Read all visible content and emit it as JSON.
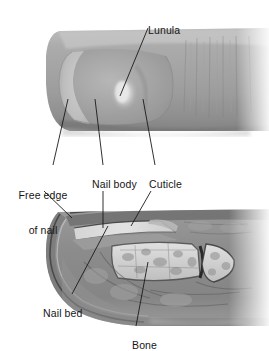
{
  "figure": {
    "title_visible": false,
    "kind": "anatomy-figure",
    "background_color": "#ffffff",
    "panels": [
      {
        "name": "fingertip-photograph",
        "description": "Grayscale photograph of a fingertip showing the nail from above",
        "bounds": {
          "x": 46,
          "y": 28,
          "width": 223,
          "height": 105
        }
      },
      {
        "name": "finger-cross-section",
        "description": "Grayscale sagittal cross-section of the distal finger showing nail, nail bed and bone",
        "bounds": {
          "x": 44,
          "y": 208,
          "width": 225,
          "height": 118
        }
      }
    ]
  },
  "labels": [
    {
      "id": "lunula",
      "text": "Lunula",
      "x": 136,
      "y": 14,
      "align": "left",
      "lines": [
        "Lunula"
      ]
    },
    {
      "id": "free-edge",
      "text": "Free edge of nail",
      "x": 13,
      "y": 168,
      "align": "center",
      "lines": [
        "Free edge",
        "of nail"
      ]
    },
    {
      "id": "nail-body",
      "text": "Nail body",
      "x": 80,
      "y": 168,
      "align": "left",
      "lines": [
        "Nail body"
      ]
    },
    {
      "id": "cuticle",
      "text": "Cuticle",
      "x": 137,
      "y": 168,
      "align": "left",
      "lines": [
        "Cuticle"
      ]
    },
    {
      "id": "nail-bed",
      "text": "Nail bed",
      "x": 31,
      "y": 297,
      "align": "left",
      "lines": [
        "Nail bed"
      ]
    },
    {
      "id": "bone",
      "text": "Bone",
      "x": 120,
      "y": 329,
      "align": "left",
      "lines": [
        "Bone"
      ]
    }
  ],
  "leader_lines": [
    {
      "id": "leader-lunula",
      "from": [
        148,
        28
      ],
      "to": [
        120,
        96
      ]
    },
    {
      "id": "leader-free-edge-up",
      "from": [
        53,
        165
      ],
      "to": [
        68,
        99
      ]
    },
    {
      "id": "leader-nail-body-up",
      "from": [
        103,
        165
      ],
      "to": [
        95,
        99
      ]
    },
    {
      "id": "leader-cuticle-up",
      "from": [
        155,
        165
      ],
      "to": [
        143,
        99
      ]
    },
    {
      "id": "leader-free-edge-down",
      "from": [
        44,
        191
      ],
      "to": [
        72,
        218
      ]
    },
    {
      "id": "leader-nail-body-down",
      "from": [
        103,
        191
      ],
      "to": [
        103,
        228
      ]
    },
    {
      "id": "leader-cuticle-down",
      "from": [
        151,
        191
      ],
      "to": [
        131,
        226
      ]
    },
    {
      "id": "leader-nail-bed",
      "from": [
        72,
        294
      ],
      "to": [
        108,
        226
      ]
    },
    {
      "id": "leader-bone",
      "from": [
        136,
        326
      ],
      "to": [
        148,
        262
      ]
    }
  ],
  "colors": {
    "label_text": "#161616",
    "leader_line": "#1a1a1a",
    "background": "#ffffff",
    "skin_mid": "#a2a2a2",
    "skin_dark": "#6e6e6e",
    "skin_light": "#c9c9c9",
    "nail_plate": "#9a9a9a",
    "lunula_highlight": "#e2e2e2",
    "section_tissue": "#8d8d8d",
    "section_bone_light": "#dcdcdc",
    "section_outline": "#3a3a3a"
  }
}
